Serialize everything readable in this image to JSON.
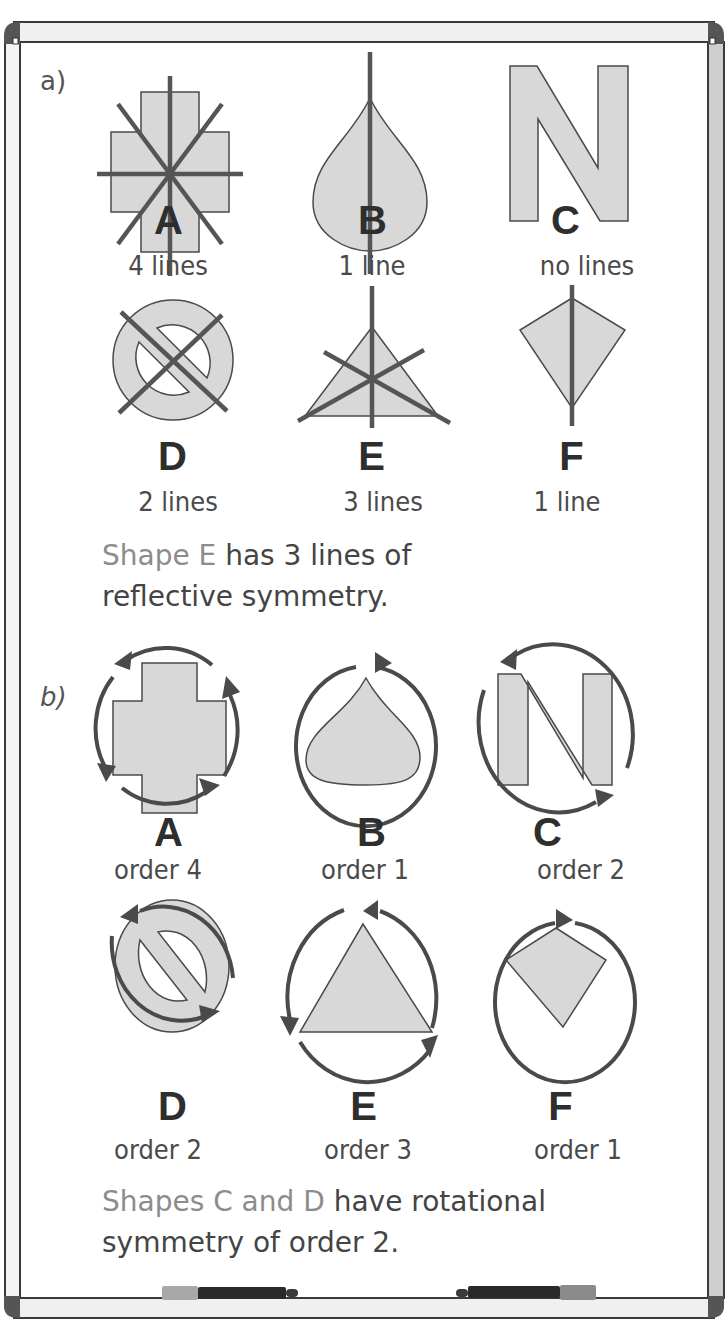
{
  "colors": {
    "frame": "#3a3a3a",
    "frame_rail": "#d9d9d9",
    "shape_fill": "#d8d8d8",
    "shape_stroke": "#4a4a4a",
    "symmetry_line": "#555555",
    "highlight_text": "#8c8c8c",
    "body_text": "#444444",
    "pen_left_cap": "#a8a8a8",
    "pen_right_cap": "#8a8a8a",
    "pen_body": "#2a2a2a"
  },
  "part_a": {
    "label": "a)",
    "shapes": [
      {
        "letter": "A",
        "caption": "4 lines",
        "shape": "cross",
        "lines_of_symmetry": 4
      },
      {
        "letter": "B",
        "caption": "1 line",
        "shape": "teardrop",
        "lines_of_symmetry": 1
      },
      {
        "letter": "C",
        "caption": "no lines",
        "shape": "letter-N",
        "lines_of_symmetry": 0
      },
      {
        "letter": "D",
        "caption": "2 lines",
        "shape": "no-entry-ring",
        "lines_of_symmetry": 2
      },
      {
        "letter": "E",
        "caption": "3 lines",
        "shape": "equilateral-triangle",
        "lines_of_symmetry": 3
      },
      {
        "letter": "F",
        "caption": "1 line",
        "shape": "kite",
        "lines_of_symmetry": 1
      }
    ],
    "conclusion": {
      "highlight": "Shape E",
      "rest_line1": " has 3 lines of",
      "line2": "reflective symmetry."
    }
  },
  "part_b": {
    "label": "b)",
    "shapes": [
      {
        "letter": "A",
        "caption": "order 4",
        "shape": "cross",
        "rotational_order": 4
      },
      {
        "letter": "B",
        "caption": "order 1",
        "shape": "teardrop",
        "rotational_order": 1
      },
      {
        "letter": "C",
        "caption": "order 2",
        "shape": "letter-N",
        "rotational_order": 2
      },
      {
        "letter": "D",
        "caption": "order 2",
        "shape": "no-entry-ring",
        "rotational_order": 2
      },
      {
        "letter": "E",
        "caption": "order 3",
        "shape": "equilateral-triangle",
        "rotational_order": 3
      },
      {
        "letter": "F",
        "caption": "order 1",
        "shape": "kite",
        "rotational_order": 1
      }
    ],
    "conclusion": {
      "highlight": "Shapes C and D",
      "rest_line1": " have rotational",
      "line2": "symmetry of order 2."
    }
  }
}
